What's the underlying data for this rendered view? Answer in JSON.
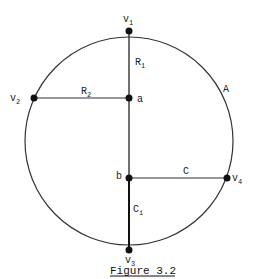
{
  "figure": {
    "caption": "Figure 3.2",
    "circle_label": "A"
  },
  "vertices": {
    "v1": {
      "base": "v",
      "sub": "1"
    },
    "v2": {
      "base": "v",
      "sub": "2"
    },
    "v3": {
      "base": "v",
      "sub": "3"
    },
    "v4": {
      "base": "v",
      "sub": "4"
    },
    "a": {
      "base": "a"
    },
    "b": {
      "base": "b"
    }
  },
  "edges": {
    "R1": {
      "base": "R",
      "sub": "1"
    },
    "R2": {
      "base": "R",
      "sub": "2"
    },
    "C": {
      "base": "C"
    },
    "Ci": {
      "base": "C",
      "sub": "i"
    }
  },
  "colors": {
    "stroke": "#222222",
    "background": "#ffffff"
  }
}
